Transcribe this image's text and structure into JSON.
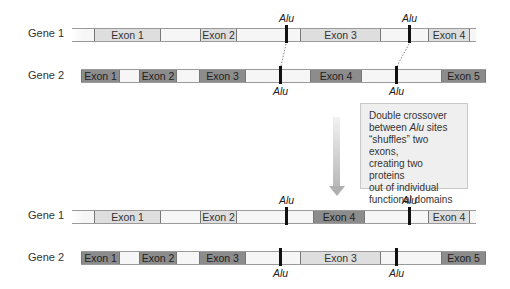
{
  "diagram": {
    "colors": {
      "light_exon": "#dedede",
      "dark_exon": "#8c8c8c",
      "intron": "#f6f6f6",
      "alu": "#111111",
      "note_bg": "#efefef"
    }
  },
  "before": {
    "gene1": {
      "label": "Gene 1",
      "exons": [
        {
          "label": "Exon 1",
          "shade": "light"
        },
        {
          "label": "Exon 2",
          "shade": "light"
        },
        {
          "label": "Exon 3",
          "shade": "light"
        },
        {
          "label": "Exon 4",
          "shade": "light"
        }
      ],
      "alu_labels": [
        "Alu",
        "Alu"
      ]
    },
    "gene2": {
      "label": "Gene 2",
      "exons": [
        {
          "label": "Exon 1",
          "shade": "dark"
        },
        {
          "label": "Exon 2",
          "shade": "dark"
        },
        {
          "label": "Exon 3",
          "shade": "dark"
        },
        {
          "label": "Exon 4",
          "shade": "dark"
        },
        {
          "label": "Exon 5",
          "shade": "dark"
        }
      ],
      "alu_labels": [
        "Alu",
        "Alu"
      ]
    }
  },
  "note": {
    "line1": "Double crossover",
    "line2_pre": "between ",
    "line2_em": "Alu",
    "line2_post": " sites",
    "line3": "“shuffles” two exons,",
    "line4": "creating two proteins",
    "line5": "out of individual",
    "line6": "functional domains"
  },
  "after": {
    "gene1": {
      "label": "Gene 1",
      "exons": [
        {
          "label": "Exon 1",
          "shade": "light"
        },
        {
          "label": "Exon 2",
          "shade": "light"
        },
        {
          "label": "Exon 4",
          "shade": "dark"
        },
        {
          "label": "Exon 4",
          "shade": "light"
        }
      ],
      "alu_labels": [
        "Alu",
        "Alu"
      ]
    },
    "gene2": {
      "label": "Gene 2",
      "exons": [
        {
          "label": "Exon 1",
          "shade": "dark"
        },
        {
          "label": "Exon 2",
          "shade": "dark"
        },
        {
          "label": "Exon 3",
          "shade": "dark"
        },
        {
          "label": "Exon 3",
          "shade": "light"
        },
        {
          "label": "Exon 5",
          "shade": "dark"
        }
      ],
      "alu_labels": [
        "Alu",
        "Alu"
      ]
    }
  }
}
